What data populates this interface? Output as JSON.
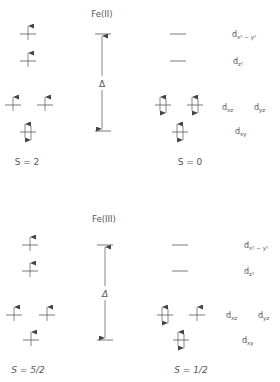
{
  "diagrams": [
    {
      "title": "Fe(II)",
      "delta_label": "Δ",
      "high_spin_label": "S = 2",
      "low_spin_label": "S = 0",
      "orbitals": [
        {
          "name": "dx2-y2",
          "label_main": "d",
          "label_sub": "x² − y²",
          "high_spin": "up",
          "low_spin": "empty"
        },
        {
          "name": "dz2",
          "label_main": "d",
          "label_sub": "z²",
          "high_spin": "up",
          "low_spin": "empty"
        },
        {
          "name": "dxz",
          "label_main": "d",
          "label_sub": "xz",
          "high_spin": "up",
          "low_spin": "pair"
        },
        {
          "name": "dyz",
          "label_main": "d",
          "label_sub": "yz",
          "high_spin": "up",
          "low_spin": "pair"
        },
        {
          "name": "dxy",
          "label_main": "d",
          "label_sub": "xy",
          "high_spin": "pair",
          "low_spin": "pair"
        }
      ]
    },
    {
      "title": "Fe(III)",
      "delta_label": "Δ",
      "high_spin_label": "S = 5/2",
      "low_spin_label": "S = 1/2",
      "orbitals": [
        {
          "name": "dx2-y2",
          "label_main": "d",
          "label_sub": "x² − y²",
          "high_spin": "up",
          "low_spin": "empty"
        },
        {
          "name": "dz2",
          "label_main": "d",
          "label_sub": "z²",
          "high_spin": "up",
          "low_spin": "empty"
        },
        {
          "name": "dxz",
          "label_main": "d",
          "label_sub": "xz",
          "high_spin": "up",
          "low_spin": "pair"
        },
        {
          "name": "dyz",
          "label_main": "d",
          "label_sub": "yz",
          "high_spin": "up",
          "low_spin": "up"
        },
        {
          "name": "dxy",
          "label_main": "d",
          "label_sub": "xy",
          "high_spin": "up",
          "low_spin": "pair"
        }
      ]
    }
  ],
  "colors": {
    "line": "#555555",
    "text": "#555555",
    "background": "#ffffff"
  }
}
